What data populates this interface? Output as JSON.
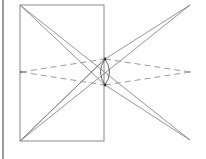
{
  "diagram": {
    "title": "",
    "colors": {
      "line": "#8a8a8a",
      "dashed": "#9a9a9a",
      "node": "#333333",
      "border": "#9a9a9a"
    }
  }
}
